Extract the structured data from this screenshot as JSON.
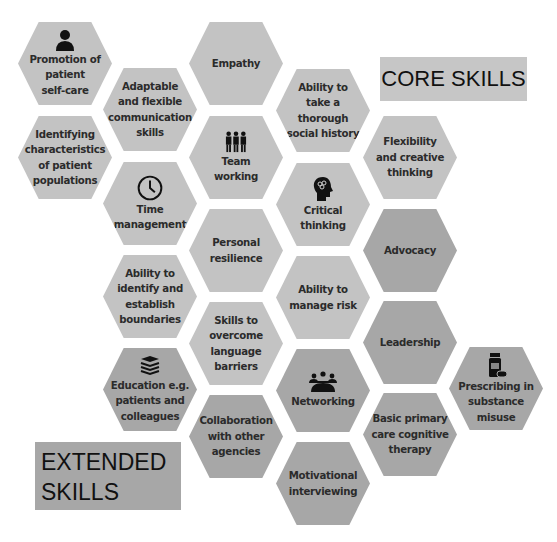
{
  "diagram": {
    "colors": {
      "light": "#c3c3c3",
      "dark": "#a7a7a7",
      "text": "#2b2b2b",
      "background": "#ffffff"
    },
    "labels": {
      "core": "CORE SKILLS",
      "extended": "EXTENDED\nSKILLS"
    },
    "hexagons": [
      {
        "id": "promotion",
        "label": "Promotion of\npatient\nself-care",
        "tone": "light",
        "icon": "person-icon"
      },
      {
        "id": "identifying",
        "label": "Identifying\ncharacteristics\nof patient\npopulations",
        "tone": "light"
      },
      {
        "id": "adaptable",
        "label": "Adaptable\nand flexible\ncommunication\nskills",
        "tone": "light"
      },
      {
        "id": "time",
        "label": "Time\nmanagement",
        "tone": "light",
        "icon": "clock-icon"
      },
      {
        "id": "boundaries",
        "label": "Ability to\nidentify and\nestablish\nboundaries",
        "tone": "light"
      },
      {
        "id": "education",
        "label": "Education e.g.\npatients and\ncolleagues",
        "tone": "dark",
        "icon": "books-icon"
      },
      {
        "id": "empathy",
        "label": "Empathy",
        "tone": "light"
      },
      {
        "id": "team",
        "label": "Team\nworking",
        "tone": "light",
        "icon": "team-icon"
      },
      {
        "id": "resilience",
        "label": "Personal\nresilience",
        "tone": "light"
      },
      {
        "id": "language",
        "label": "Skills to\novercome\nlanguage\nbarriers",
        "tone": "light"
      },
      {
        "id": "collaboration",
        "label": "Collaboration\nwith other\nagencies",
        "tone": "dark"
      },
      {
        "id": "history",
        "label": "Ability to\ntake a thorough\nsocial history",
        "tone": "light"
      },
      {
        "id": "critical",
        "label": "Critical\nthinking",
        "tone": "light",
        "icon": "brain-head-icon"
      },
      {
        "id": "risk",
        "label": "Ability to\nmanage risk",
        "tone": "light"
      },
      {
        "id": "networking",
        "label": "Networking",
        "tone": "dark",
        "icon": "meeting-icon"
      },
      {
        "id": "motivational",
        "label": "Motivational\ninterviewing",
        "tone": "dark"
      },
      {
        "id": "flexibility",
        "label": "Flexibility\nand creative\nthinking",
        "tone": "light"
      },
      {
        "id": "advocacy",
        "label": "Advocacy",
        "tone": "dark"
      },
      {
        "id": "leadership",
        "label": "Leadership",
        "tone": "dark"
      },
      {
        "id": "cbt",
        "label": "Basic primary\ncare cognitive\ntherapy",
        "tone": "dark"
      },
      {
        "id": "prescribing",
        "label": "Prescribing in\nsubstance\nmisuse",
        "tone": "dark",
        "icon": "medicine-bottle-icon"
      }
    ]
  }
}
